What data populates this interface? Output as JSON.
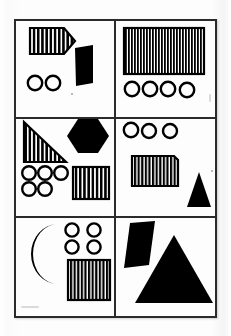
{
  "document": {
    "title": "Geometric Shapes Grid Sheet",
    "type": "shape-panel-grid",
    "background_color": "#fbfbfb",
    "paper_color": "#fdfdfd",
    "ink_color": "#000000",
    "border_color": "#2b2b2b",
    "grid": {
      "columns": 2,
      "rows": 3,
      "panel_count": 6
    }
  },
  "panels": [
    {
      "id": "panel-top-left",
      "row": 1,
      "column": 1,
      "position_label": "top-left",
      "shape_count": 4,
      "shapes": [
        {
          "name": "striped-pentagon",
          "kind": "pentagon-tag",
          "fill": "striped",
          "color": "#000000",
          "stripes": 11,
          "count": 1
        },
        {
          "name": "black-quadrilateral",
          "kind": "quadrilateral",
          "fill": "solid",
          "color": "#000000",
          "count": 1
        },
        {
          "name": "circle-outline-pair",
          "kind": "circle",
          "fill": "outline",
          "color": "#000000",
          "count": 2
        }
      ]
    },
    {
      "id": "panel-top-right",
      "row": 1,
      "column": 2,
      "position_label": "top-right",
      "shape_count": 5,
      "shapes": [
        {
          "name": "striped-rectangle-large",
          "kind": "rectangle",
          "fill": "striped",
          "color": "#000000",
          "stripes": 20,
          "count": 1
        },
        {
          "name": "circle-outline-row",
          "kind": "circle",
          "fill": "outline",
          "color": "#000000",
          "count": 4
        }
      ]
    },
    {
      "id": "panel-middle-left",
      "row": 2,
      "column": 1,
      "position_label": "middle-left",
      "shape_count": 8,
      "shapes": [
        {
          "name": "striped-right-triangle",
          "kind": "right-triangle",
          "fill": "striped",
          "color": "#000000",
          "stripes": 11,
          "count": 1
        },
        {
          "name": "black-hexagon",
          "kind": "hexagon",
          "fill": "solid",
          "color": "#000000",
          "count": 1
        },
        {
          "name": "circle-outline-cluster",
          "kind": "circle",
          "fill": "outline",
          "color": "#000000",
          "count": 5
        },
        {
          "name": "striped-square",
          "kind": "square",
          "fill": "striped",
          "color": "#000000",
          "stripes": 11,
          "count": 1
        }
      ]
    },
    {
      "id": "panel-middle-right",
      "row": 2,
      "column": 2,
      "position_label": "middle-right",
      "shape_count": 5,
      "shapes": [
        {
          "name": "circle-outline-row",
          "kind": "circle",
          "fill": "outline",
          "color": "#000000",
          "count": 3
        },
        {
          "name": "striped-rectangle-clipped",
          "kind": "rectangle-clipped-corner",
          "fill": "striped",
          "color": "#000000",
          "stripes": 12,
          "count": 1
        },
        {
          "name": "black-triangle-small",
          "kind": "triangle",
          "fill": "solid",
          "color": "#000000",
          "count": 1
        }
      ]
    },
    {
      "id": "panel-bottom-left",
      "row": 3,
      "column": 1,
      "position_label": "bottom-left",
      "shape_count": 6,
      "shapes": [
        {
          "name": "black-crescent-moon",
          "kind": "crescent",
          "fill": "solid",
          "color": "#000000",
          "count": 1
        },
        {
          "name": "circle-outline-grid",
          "kind": "circle",
          "fill": "outline",
          "color": "#000000",
          "count": 4
        },
        {
          "name": "striped-square",
          "kind": "square",
          "fill": "striped",
          "color": "#000000",
          "stripes": 12,
          "count": 1
        }
      ]
    },
    {
      "id": "panel-bottom-right",
      "row": 3,
      "column": 2,
      "position_label": "bottom-right",
      "shape_count": 2,
      "shapes": [
        {
          "name": "black-parallelogram",
          "kind": "parallelogram",
          "fill": "solid",
          "color": "#000000",
          "count": 1
        },
        {
          "name": "black-triangle-large",
          "kind": "triangle",
          "fill": "solid",
          "color": "#000000",
          "count": 1
        }
      ]
    }
  ]
}
